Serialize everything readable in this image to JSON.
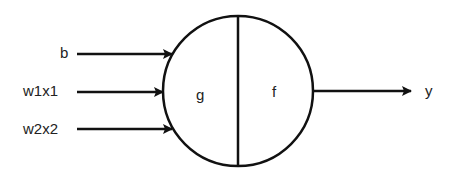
{
  "diagram": {
    "inputs": [
      {
        "label": "b",
        "y": 53
      },
      {
        "label": "w1x1",
        "y": 91
      },
      {
        "label": "w2x2",
        "y": 129
      }
    ],
    "neuron": {
      "left_label": "g",
      "right_label": "f",
      "cx": 238,
      "cy": 91,
      "r": 75
    },
    "output": {
      "label": "y",
      "y": 91
    },
    "colors": {
      "stroke": "#111111",
      "text": "#222222",
      "background": "#ffffff"
    }
  }
}
